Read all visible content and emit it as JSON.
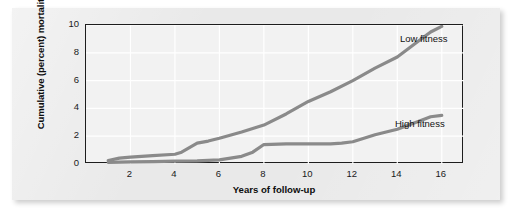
{
  "chart_data": {
    "type": "line",
    "title": "",
    "xlabel": "Years of follow-up",
    "ylabel": "Cumulative (percent) mortality",
    "xlim": [
      0,
      17
    ],
    "ylim": [
      0,
      10
    ],
    "xticks": [
      "2",
      "4",
      "6",
      "8",
      "10",
      "12",
      "14",
      "16"
    ],
    "xtick_values": [
      2,
      4,
      6,
      8,
      10,
      12,
      14,
      16
    ],
    "yticks": [
      "0",
      "2",
      "4",
      "6",
      "8",
      "10"
    ],
    "ytick_values": [
      0,
      2,
      4,
      6,
      8,
      10
    ],
    "grid": true,
    "legend_position": "inline-right",
    "line_color": "#8a8a8a",
    "series": [
      {
        "name": "Low fitness",
        "label": "Low fitness",
        "x": [
          1.0,
          1.5,
          2.0,
          3.0,
          4.0,
          4.3,
          5.0,
          5.5,
          6.0,
          7.0,
          8.0,
          9.0,
          10.0,
          11.0,
          12.0,
          13.0,
          14.0,
          15.0,
          15.5,
          16.0
        ],
        "values": [
          0.25,
          0.42,
          0.5,
          0.6,
          0.7,
          0.85,
          1.5,
          1.65,
          1.85,
          2.3,
          2.8,
          3.6,
          4.5,
          5.2,
          6.0,
          6.9,
          7.7,
          8.9,
          9.5,
          9.9
        ]
      },
      {
        "name": "High fitness",
        "label": "High fitness",
        "x": [
          1.0,
          2.0,
          3.0,
          4.0,
          5.0,
          6.0,
          7.0,
          7.5,
          8.0,
          9.0,
          10.0,
          11.0,
          11.5,
          12.0,
          13.0,
          14.0,
          15.0,
          15.5,
          16.0
        ],
        "values": [
          0.12,
          0.15,
          0.17,
          0.2,
          0.22,
          0.3,
          0.55,
          0.85,
          1.4,
          1.45,
          1.45,
          1.45,
          1.5,
          1.6,
          2.1,
          2.5,
          3.1,
          3.4,
          3.5
        ]
      }
    ]
  },
  "labels": {
    "low_fitness": "Low fitness",
    "high_fitness": "High fitness"
  }
}
